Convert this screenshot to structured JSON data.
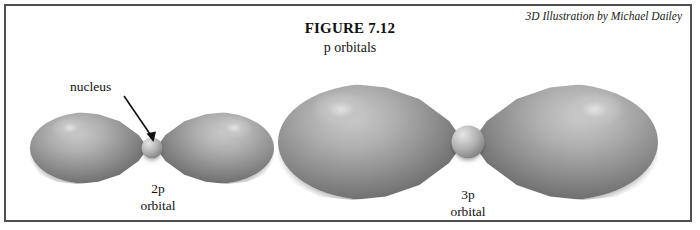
{
  "figure": {
    "title": "FIGURE 7.12",
    "subtitle": "p orbitals",
    "credit": "3D Illustration by Michael Dailey"
  },
  "annotations": {
    "nucleus_label": "nucleus",
    "arrow_icon": "callout-arrow-icon"
  },
  "orbitals": [
    {
      "name": "2p",
      "label_line1": "2p",
      "label_line2": "orbital",
      "lobes": 2,
      "has_nucleus": true
    },
    {
      "name": "3p",
      "label_line1": "3p",
      "label_line2": "orbital",
      "lobes": 2,
      "has_nucleus": true
    }
  ],
  "colors": {
    "background": "#ffffff",
    "frame_border": "#4e4e4e",
    "text": "#111111",
    "lobe_highlight": "#e2e2e2",
    "lobe_midtone": "#b0b0b0",
    "lobe_shadow": "#515151"
  }
}
